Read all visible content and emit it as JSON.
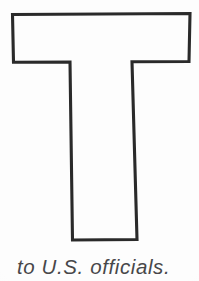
{
  "page": {
    "kind": "scanned-book-page",
    "background_color": "#fdfdfd"
  },
  "letterform": {
    "character": "T",
    "icon_name": "letter-t-outline",
    "style": "outline",
    "stroke_color": "#2a2a2a",
    "fill_color": "#fdfdfd",
    "stroke_width": "3",
    "description": "Large outlined capital letter T",
    "geometry": {
      "crossbar": {
        "left": 12,
        "top": 14,
        "right": 190,
        "bottom": 62
      },
      "stem": {
        "top_left": 70,
        "top_right": 132,
        "bottom_left": 72,
        "bottom_right": 137,
        "bottom": 240
      }
    }
  },
  "caption": {
    "text": "to U.S. officials.",
    "style": "italic",
    "color": "#3a3a3c",
    "clipped": "bottom"
  }
}
